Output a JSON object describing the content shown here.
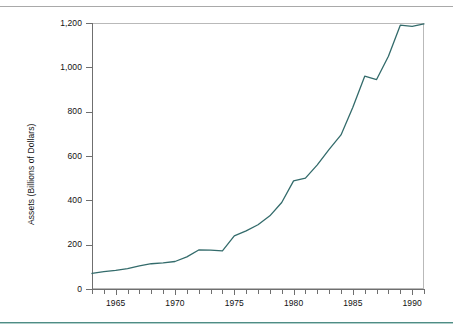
{
  "figure": {
    "accent_color": "#4f8c85",
    "line_color": "#336b6b",
    "frame_color": "#b9b9b9",
    "axis_color": "#6f6f6f"
  },
  "chart_data": {
    "type": "line",
    "title": "",
    "subtitle": "",
    "xlabel": "",
    "ylabel": "Assets (Billions of Dollars)",
    "xlim": [
      1963,
      1991
    ],
    "ylim": [
      0,
      1200
    ],
    "grid": false,
    "legend": false,
    "legend_position": "none",
    "y_ticks": [
      0,
      200,
      400,
      600,
      800,
      1000,
      1200
    ],
    "y_tick_labels": [
      "0",
      "200",
      "400",
      "600",
      "800",
      "1,000",
      "1,200"
    ],
    "x_ticks": [
      1963,
      1964,
      1965,
      1966,
      1967,
      1968,
      1969,
      1970,
      1971,
      1972,
      1973,
      1974,
      1975,
      1976,
      1977,
      1978,
      1979,
      1980,
      1981,
      1982,
      1983,
      1984,
      1985,
      1986,
      1987,
      1988,
      1989,
      1990,
      1991
    ],
    "x_tick_labels": [
      "1965",
      "1970",
      "1975",
      "1980",
      "1985",
      "1990"
    ],
    "x_major_ticks": [
      1965,
      1970,
      1975,
      1980,
      1985,
      1990
    ],
    "x": [
      1963,
      1964,
      1965,
      1966,
      1967,
      1968,
      1969,
      1970,
      1971,
      1972,
      1973,
      1974,
      1975,
      1976,
      1977,
      1978,
      1979,
      1980,
      1981,
      1982,
      1983,
      1984,
      1985,
      1986,
      1987,
      1988,
      1989,
      1990,
      1991
    ],
    "values": [
      70,
      78,
      84,
      92,
      104,
      114,
      118,
      124,
      145,
      176,
      175,
      172,
      240,
      262,
      290,
      330,
      390,
      488,
      500,
      560,
      630,
      695,
      820,
      960,
      945,
      1050,
      1190,
      1185,
      1196
    ],
    "series": [
      {
        "name": "Assets",
        "values": [
          70,
          78,
          84,
          92,
          104,
          114,
          118,
          124,
          145,
          176,
          175,
          172,
          240,
          262,
          290,
          330,
          390,
          488,
          500,
          560,
          630,
          695,
          820,
          960,
          945,
          1050,
          1190,
          1185,
          1196
        ]
      }
    ]
  }
}
